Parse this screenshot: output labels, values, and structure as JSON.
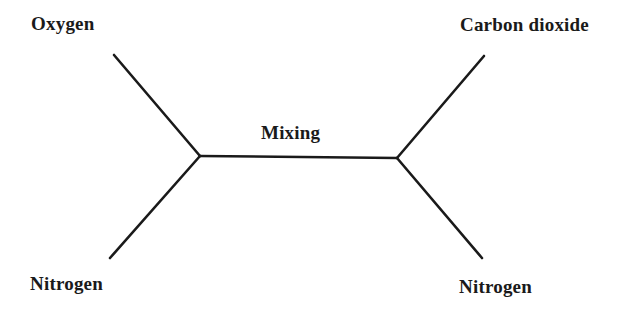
{
  "diagram": {
    "type": "gas-exchange-flow",
    "stroke_color": "#1a1a1a",
    "text_color": "#1a1a1a",
    "background": "#ffffff",
    "labels": {
      "input_top": "Oxygen",
      "input_bottom": "Nitrogen",
      "center": "Mixing",
      "output_top": "Carbon dioxide",
      "output_bottom": "Nitrogen"
    },
    "nodes": {
      "left_junction": {
        "x": 200,
        "y": 156
      },
      "right_junction": {
        "x": 397,
        "y": 158
      }
    },
    "edges": [
      {
        "from": "Oxygen",
        "to": "left_junction"
      },
      {
        "from": "Nitrogen (in)",
        "to": "left_junction"
      },
      {
        "from": "left_junction",
        "to": "right_junction",
        "label": "Mixing"
      },
      {
        "from": "right_junction",
        "to": "Carbon dioxide"
      },
      {
        "from": "right_junction",
        "to": "Nitrogen (out)"
      }
    ]
  }
}
